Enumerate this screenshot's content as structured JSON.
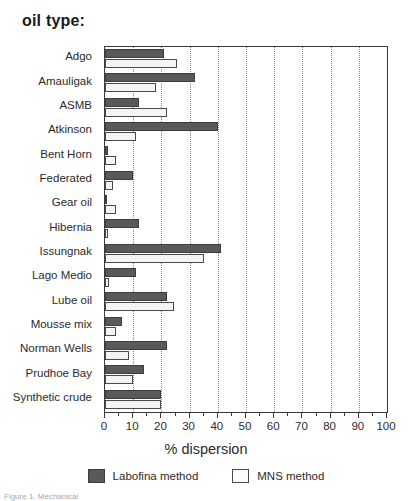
{
  "title": "oil type:",
  "caption": "Figure 1. Mechanical",
  "axis": {
    "x_title": "% dispersion",
    "x_ticks": [
      "0",
      "10",
      "20",
      "30",
      "40",
      "50",
      "60",
      "70",
      "80",
      "90",
      "100"
    ]
  },
  "legend": {
    "entries": [
      {
        "label": "Labofina method",
        "swatch": "dark",
        "color": "#595959"
      },
      {
        "label": "MNS method",
        "swatch": "light",
        "color": "#fbfbf8"
      }
    ]
  },
  "chart_data": {
    "type": "bar",
    "orientation": "horizontal",
    "title": "oil type:",
    "xlabel": "% dispersion",
    "ylabel": "oil type:",
    "xlim": [
      0,
      100
    ],
    "grid": true,
    "legend_position": "bottom",
    "categories": [
      "Adgo",
      "Amauligak",
      "ASMB",
      "Atkinson",
      "Bent Horn",
      "Federated",
      "Gear oil",
      "Hibernia",
      "Issungnak",
      "Lago Medio",
      "Lube oil",
      "Mousse mix",
      "Norman Wells",
      "Prudhoe Bay",
      "Synthetic crude"
    ],
    "series": [
      {
        "name": "Labofina method",
        "color": "#595959",
        "values": [
          21,
          32,
          12,
          40,
          1,
          10,
          0.5,
          12,
          41,
          11,
          22,
          6,
          22,
          14,
          20
        ]
      },
      {
        "name": "MNS method",
        "color": "#fbfbf8",
        "values": [
          25.5,
          18,
          22,
          11,
          4,
          3,
          4,
          1,
          35,
          1.5,
          24.5,
          4,
          8.5,
          10,
          20
        ]
      }
    ]
  }
}
